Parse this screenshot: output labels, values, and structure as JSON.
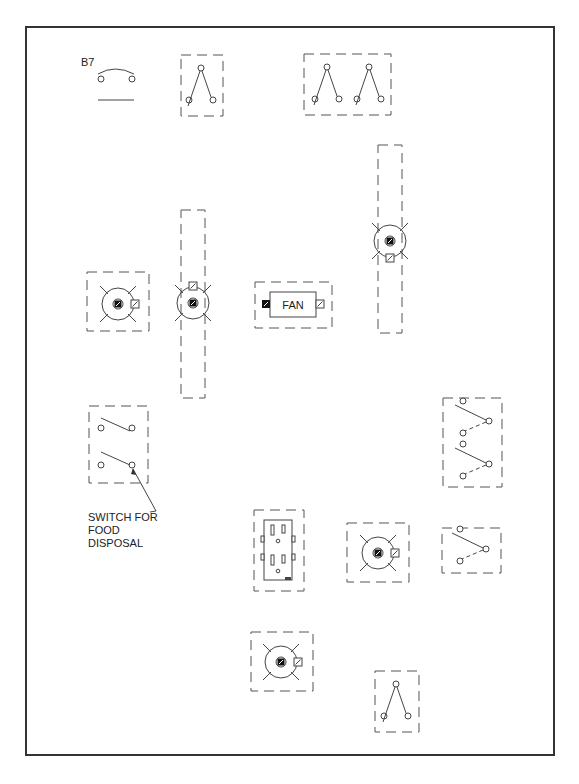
{
  "diagram": {
    "id_label": "B7",
    "fan_label": "FAN",
    "callout": {
      "line1": "SWITCH FOR",
      "line2": "FOOD",
      "line3": "DISPOSAL"
    },
    "components": [
      {
        "type": "bell-symbol",
        "label": "B7"
      },
      {
        "type": "three-way-switch",
        "count": 1
      },
      {
        "type": "three-way-switch-gang",
        "count": 2
      },
      {
        "type": "ceiling-light-box",
        "count": 3
      },
      {
        "type": "light-on-strip",
        "count": 2
      },
      {
        "type": "fan",
        "label": "FAN"
      },
      {
        "type": "single-pole-switch-double",
        "note": "SWITCH FOR FOOD DISPOSAL"
      },
      {
        "type": "duplex-receptacle"
      },
      {
        "type": "four-way-switch-double"
      },
      {
        "type": "four-way-switch-single"
      },
      {
        "type": "three-way-switch-bottom"
      }
    ],
    "colors": {
      "line": "#444444",
      "frame": "#333333",
      "background": "#ffffff"
    }
  }
}
